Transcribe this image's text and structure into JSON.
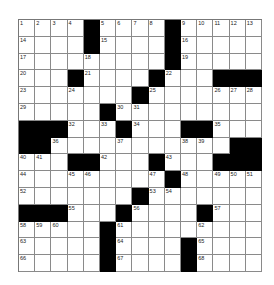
{
  "puzzle": {
    "rows": 15,
    "cols": 15,
    "grid": [
      [
        "1",
        "2",
        "3",
        "4",
        "#",
        "5",
        "6",
        "7",
        "8",
        "#",
        "9",
        "10",
        "11",
        "12",
        "13"
      ],
      [
        "14",
        "",
        "",
        "",
        "#",
        "15",
        "",
        "",
        "",
        "#",
        "16",
        "",
        "",
        "",
        ""
      ],
      [
        "17",
        "",
        "",
        "",
        "18",
        "",
        "",
        "",
        "",
        "#",
        "19",
        "",
        "",
        "",
        ""
      ],
      [
        "20",
        "",
        "",
        "#",
        "21",
        "",
        "",
        "",
        "#",
        "22",
        "",
        "",
        "#",
        "#",
        "#"
      ],
      [
        "23",
        "",
        "",
        "24",
        "",
        "",
        "",
        "#",
        "25",
        "",
        "",
        "",
        "26",
        "27",
        "28"
      ],
      [
        "29",
        "",
        "",
        "",
        "",
        "#",
        "30",
        "31",
        "",
        "",
        "",
        "",
        "",
        "",
        ""
      ],
      [
        "#",
        "#",
        "#",
        "32",
        "",
        "33",
        "#",
        "34",
        "",
        "",
        "#",
        "#",
        "35",
        "",
        ""
      ],
      [
        "#",
        "#",
        "36",
        "",
        "",
        "",
        "37",
        "",
        "",
        "",
        "38",
        "39",
        "",
        "#",
        "#"
      ],
      [
        "40",
        "41",
        "",
        "#",
        "#",
        "42",
        "",
        "",
        "#",
        "43",
        "",
        "",
        "#",
        "#",
        "#"
      ],
      [
        "44",
        "",
        "",
        "45",
        "46",
        "",
        "",
        "",
        "47",
        "#",
        "48",
        "",
        "49",
        "50",
        "51"
      ],
      [
        "52",
        "",
        "",
        "",
        "",
        "",
        "",
        "#",
        "53",
        "54",
        "",
        "",
        "",
        "",
        ""
      ],
      [
        "#",
        "#",
        "#",
        "55",
        "",
        "",
        "#",
        "56",
        "",
        "",
        "",
        "#",
        "57",
        "",
        ""
      ],
      [
        "58",
        "59",
        "60",
        "",
        "",
        "#",
        "61",
        "",
        "",
        "",
        "",
        "62",
        "",
        "",
        ""
      ],
      [
        "63",
        "",
        "",
        "",
        "",
        "#",
        "64",
        "",
        "",
        "",
        "#",
        "65",
        "",
        "",
        ""
      ],
      [
        "66",
        "",
        "",
        "",
        "",
        "#",
        "67",
        "",
        "",
        "",
        "#",
        "68",
        "",
        "",
        ""
      ]
    ]
  }
}
